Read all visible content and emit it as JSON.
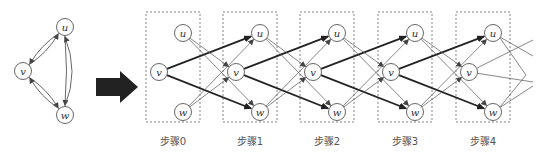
{
  "source_graph": {
    "nodes": [
      {
        "id": "u",
        "label": "u",
        "x": 65,
        "y": 27
      },
      {
        "id": "v",
        "label": "v",
        "x": 23,
        "y": 71
      },
      {
        "id": "w",
        "label": "w",
        "x": 65,
        "y": 115
      }
    ],
    "edges": [
      {
        "from": "v",
        "to": "u"
      },
      {
        "from": "u",
        "to": "v"
      },
      {
        "from": "v",
        "to": "w"
      },
      {
        "from": "w",
        "to": "v"
      },
      {
        "from": "u",
        "to": "w"
      },
      {
        "from": "w",
        "to": "u"
      }
    ]
  },
  "transform_arrow": {
    "color": "#222222"
  },
  "stages": [
    {
      "label": "步骤0",
      "box_x": 146
    },
    {
      "label": "步骤1",
      "box_x": 223
    },
    {
      "label": "步骤2",
      "box_x": 300
    },
    {
      "label": "步骤3",
      "box_x": 378
    },
    {
      "label": "步骤4",
      "box_x": 456
    }
  ],
  "node_labels": {
    "u": "u",
    "v": "v",
    "w": "w"
  },
  "colors": {
    "edge": "#555555",
    "bold_edge": "#222222",
    "box": "#777777",
    "node": "#555555"
  }
}
